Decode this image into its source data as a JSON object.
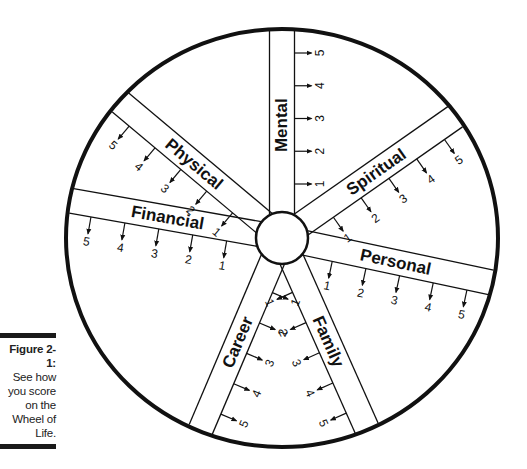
{
  "figure": {
    "label": "Figure 2-1:",
    "caption": [
      "See how",
      "you score",
      "on the",
      "Wheel of",
      "Life."
    ]
  },
  "wheel": {
    "center": [
      282,
      238
    ],
    "outer_radius": [
      216,
      209
    ],
    "hub_radius": 26,
    "band_width": 25,
    "colors": {
      "stroke": "#111111",
      "background": "#ffffff"
    },
    "spokes": [
      {
        "label": "Mental",
        "angle": -90,
        "tick_side": 1,
        "scores": [
          "1",
          "2",
          "3",
          "4",
          "5"
        ]
      },
      {
        "label": "Spiritual",
        "angle": -35,
        "tick_side": 1,
        "scores": [
          "1",
          "2",
          "3",
          "4",
          "5"
        ]
      },
      {
        "label": "Personal",
        "angle": 12,
        "tick_side": 1,
        "scores": [
          "1",
          "2",
          "3",
          "4",
          "5"
        ]
      },
      {
        "label": "Family",
        "angle": 66,
        "tick_side": 1,
        "scores": [
          "1",
          "2",
          "3",
          "4",
          "5"
        ]
      },
      {
        "label": "Career",
        "angle": 113,
        "tick_side": -1,
        "scores": [
          "1",
          "2",
          "3",
          "4",
          "5"
        ]
      },
      {
        "label": "Financial",
        "angle": 190,
        "tick_side": -1,
        "scores": [
          "1",
          "2",
          "3",
          "4",
          "5"
        ]
      },
      {
        "label": "Physical",
        "angle": 220,
        "tick_side": -1,
        "scores": [
          "1",
          "2",
          "3",
          "4",
          "5"
        ]
      }
    ]
  }
}
